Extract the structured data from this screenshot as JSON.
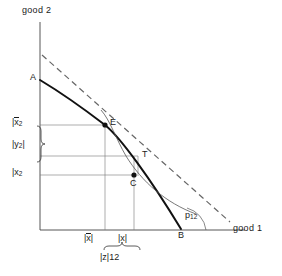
{
  "figure": {
    "type": "economics-diagram"
  },
  "axes": {
    "y_label": "good 2",
    "x_label": "good 1"
  },
  "points": [
    {
      "id": "A",
      "label": "A",
      "x": 40,
      "y": 80,
      "marker": false
    },
    {
      "id": "E",
      "label": "E",
      "x": 105,
      "y": 124,
      "marker": true
    },
    {
      "id": "T",
      "label": "T",
      "x": 138,
      "y": 156,
      "marker": false
    },
    {
      "id": "C",
      "label": "C",
      "x": 134,
      "y": 176,
      "marker": true
    },
    {
      "id": "B",
      "label": "B",
      "x": 181,
      "y": 229,
      "marker": false
    }
  ],
  "angle": {
    "label": "p",
    "subscript": "12"
  },
  "y_ticks": [
    {
      "id": "xbar2",
      "base": "x",
      "overbar": true,
      "subscript": "2",
      "value_y": 125
    },
    {
      "id": "y2",
      "base": "y",
      "overbar": false,
      "subscript": "2",
      "value_y": 146
    },
    {
      "id": "x2",
      "base": "x",
      "overbar": false,
      "subscript": "2",
      "value_y": 175
    }
  ],
  "x_ticks": [
    {
      "id": "xbar1",
      "base": "x",
      "overbar": true,
      "subscript": "1",
      "value_x": 105
    },
    {
      "id": "x1",
      "base": "x",
      "overbar": false,
      "subscript": "1",
      "value_x": 134
    }
  ],
  "brace_labels": [
    {
      "id": "z12",
      "base": "z",
      "subscript": "12",
      "orientation": "horizontal"
    }
  ],
  "curves": {
    "ppf": {
      "style": "solid",
      "width": 2.0,
      "color": "#111111"
    },
    "budget_line": {
      "style": "dashed",
      "width": 1.2,
      "color": "#666666"
    },
    "indifference": {
      "style": "solid",
      "width": 0.8,
      "color": "#555555"
    },
    "guide_lines": {
      "style": "solid",
      "width": 0.6,
      "color": "#777777"
    },
    "axes": {
      "style": "solid",
      "width": 0.9,
      "color": "#444444"
    }
  },
  "colors": {
    "background": "#ffffff",
    "ink": "#1a1a1a",
    "grey": "#777777"
  }
}
